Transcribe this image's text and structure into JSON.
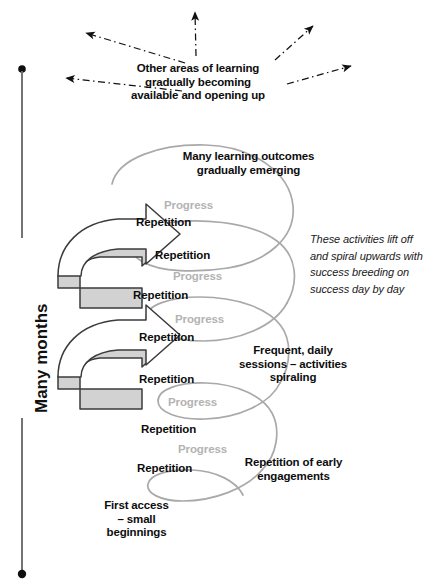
{
  "diagram": {
    "axis": {
      "label": "Many months",
      "orientation": "vertical",
      "direction": "bottom-to-top"
    },
    "top_callout": {
      "lines": [
        "Other areas of learning",
        "gradually becoming",
        "available and opening up"
      ],
      "arrows": 5,
      "arrow_style": "dash-dot"
    },
    "callouts": [
      {
        "id": "many-learning-outcomes",
        "lines": [
          "Many learning outcomes",
          "gradually emerging"
        ]
      },
      {
        "id": "frequent-daily-sessions",
        "lines": [
          "Frequent, daily",
          "sessions – activities",
          "spiraling"
        ]
      },
      {
        "id": "repetition-of-early-engagements",
        "lines": [
          "Repetition of early",
          "engagements"
        ]
      },
      {
        "id": "first-access",
        "lines": [
          "First access",
          "– small",
          "beginnings"
        ]
      }
    ],
    "side_note": {
      "lines": [
        "These activities lift off",
        "and spiral upwards with",
        "success breeding on",
        "success day by day"
      ]
    },
    "cycle_labels": [
      {
        "id": "prog-1",
        "kind": "Progress",
        "text": "Progress"
      },
      {
        "id": "rep-1",
        "kind": "Repetition",
        "text": "Repetition"
      },
      {
        "id": "rep-2",
        "kind": "Repetition",
        "text": "Repetition"
      },
      {
        "id": "prog-2",
        "kind": "Progress",
        "text": "Progress"
      },
      {
        "id": "rep-3",
        "kind": "Repetition",
        "text": "Repetition"
      },
      {
        "id": "prog-3",
        "kind": "Progress",
        "text": "Progress"
      },
      {
        "id": "rep-4",
        "kind": "Repetition",
        "text": "Repetition"
      },
      {
        "id": "rep-5",
        "kind": "Repetition",
        "text": "Repetition"
      },
      {
        "id": "prog-4",
        "kind": "Progress",
        "text": "Progress"
      },
      {
        "id": "rep-6",
        "kind": "Repetition",
        "text": "Repetition"
      },
      {
        "id": "prog-5",
        "kind": "Progress",
        "text": "Progress"
      },
      {
        "id": "rep-7",
        "kind": "Repetition",
        "text": "Repetition"
      }
    ],
    "colors": {
      "text": "#0d0d0d",
      "progress_text": "#b3b3b3",
      "spiral_line": "#a9a9a9",
      "arrow_outline": "#3b3b3b",
      "arrow_fill_light": "#ffffff",
      "arrow_fill_shade": "#d2d2d2",
      "axis": "#6e6e6e",
      "background": "#ffffff"
    }
  }
}
